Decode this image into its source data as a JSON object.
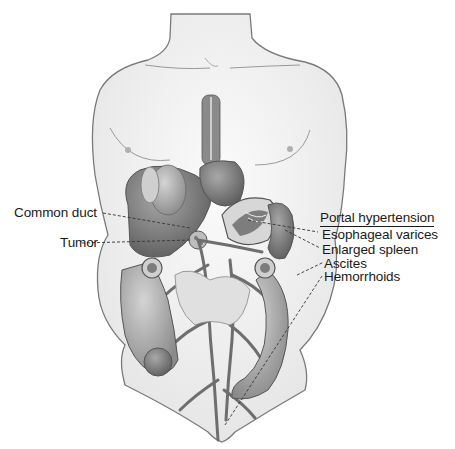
{
  "figure": {
    "style": "grayscale pencil drawing"
  },
  "labels_left": [
    {
      "text": "Common duct",
      "x": 14,
      "y": 207
    },
    {
      "text": "Tumor",
      "x": 60,
      "y": 238
    }
  ],
  "labels_right": {
    "heading": "Portal hypertension",
    "items": [
      {
        "text": "Esophageal varices"
      },
      {
        "text": "Enlarged spleen"
      },
      {
        "text": "Ascites"
      },
      {
        "text": "Hemorrhoids"
      }
    ]
  },
  "colors": {
    "skin_outline": "#7a7a7a",
    "skin_fill": "#f4f4f4",
    "organ_dark": "#6e6e6e",
    "organ_mid": "#9a9a9a",
    "organ_light": "#c4c4c4",
    "text": "#1a1a1a"
  }
}
